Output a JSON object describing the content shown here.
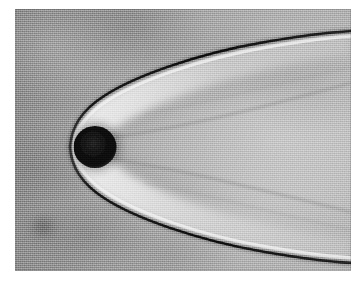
{
  "figure": {
    "kind": "schlieren-shadowgraph-photograph",
    "caption": "",
    "medium": "black-and-white photographic print",
    "border_color": "#ffffff",
    "print_area": {
      "x": 15,
      "y": 9,
      "width": 336,
      "height": 262
    }
  },
  "chart_data": {
    "type": "scatter",
    "title": "",
    "subtitle": "",
    "xlabel": "",
    "ylabel": "",
    "grid": false,
    "legend": "none",
    "xlim": [
      0,
      336
    ],
    "ylim": [
      0,
      262
    ],
    "description": "Shadowgraph of a detached bow shock wave formed ahead of a sphere in supersonic free flight; flow is from right to left, the shock opens downstream toward the right of the frame.",
    "annotations": [
      {
        "name": "sphere",
        "label": "",
        "cx": 80,
        "cy": 138,
        "r": 21,
        "tone": "#141414"
      },
      {
        "name": "shock-vertex",
        "label": "",
        "x": 55,
        "y": 138
      },
      {
        "name": "stand-off-distance-px",
        "label": "",
        "value": 4
      },
      {
        "name": "upper-shock-exit",
        "label": "",
        "x": 336,
        "y": 34
      },
      {
        "name": "lower-shock-exit",
        "label": "",
        "x": 336,
        "y": 226
      }
    ],
    "series": [
      {
        "name": "bow-shock-upper",
        "role": "primary-shock",
        "tone": "#1b1b1b",
        "points": [
          [
            55,
            138
          ],
          [
            58,
            122
          ],
          [
            64,
            110
          ],
          [
            74,
            99
          ],
          [
            88,
            89
          ],
          [
            106,
            80
          ],
          [
            130,
            70
          ],
          [
            160,
            60
          ],
          [
            196,
            50
          ],
          [
            240,
            41
          ],
          [
            290,
            33
          ],
          [
            336,
            27
          ]
        ]
      },
      {
        "name": "bow-shock-lower",
        "role": "primary-shock",
        "tone": "#1b1b1b",
        "points": [
          [
            55,
            138
          ],
          [
            58,
            154
          ],
          [
            64,
            167
          ],
          [
            75,
            179
          ],
          [
            90,
            190
          ],
          [
            110,
            200
          ],
          [
            136,
            211
          ],
          [
            168,
            221
          ],
          [
            206,
            230
          ],
          [
            252,
            238
          ],
          [
            296,
            244
          ],
          [
            336,
            249
          ]
        ]
      },
      {
        "name": "shock-layer-upper",
        "role": "bright-compression-band",
        "tone": "#e6e6e6",
        "points": [
          [
            60,
            138
          ],
          [
            63,
            124
          ],
          [
            70,
            112
          ],
          [
            80,
            101
          ],
          [
            95,
            92
          ],
          [
            114,
            83
          ],
          [
            140,
            74
          ],
          [
            172,
            64
          ],
          [
            210,
            55
          ],
          [
            254,
            46
          ],
          [
            300,
            39
          ],
          [
            336,
            34
          ]
        ]
      },
      {
        "name": "shock-layer-lower",
        "role": "bright-compression-band",
        "tone": "#e6e6e6",
        "points": [
          [
            60,
            138
          ],
          [
            63,
            152
          ],
          [
            70,
            164
          ],
          [
            81,
            176
          ],
          [
            96,
            186
          ],
          [
            117,
            196
          ],
          [
            143,
            206
          ],
          [
            175,
            216
          ],
          [
            212,
            224
          ],
          [
            257,
            232
          ],
          [
            300,
            238
          ],
          [
            336,
            242
          ]
        ]
      },
      {
        "name": "wake-boundary-upper",
        "role": "secondary-wave",
        "tone": "#8d8d8d",
        "points": [
          [
            100,
            128
          ],
          [
            126,
            124
          ],
          [
            158,
            118
          ],
          [
            196,
            110
          ],
          [
            238,
            100
          ],
          [
            284,
            88
          ],
          [
            336,
            74
          ]
        ]
      },
      {
        "name": "wake-boundary-lower",
        "role": "secondary-wave",
        "tone": "#8d8d8d",
        "points": [
          [
            100,
            150
          ],
          [
            126,
            155
          ],
          [
            158,
            161
          ],
          [
            196,
            169
          ],
          [
            238,
            179
          ],
          [
            284,
            190
          ],
          [
            336,
            203
          ]
        ]
      },
      {
        "name": "expansion-wave-upper",
        "role": "secondary-wave",
        "tone": "#9b9b9b",
        "points": [
          [
            130,
            105
          ],
          [
            170,
            97
          ],
          [
            214,
            87
          ],
          [
            262,
            75
          ],
          [
            336,
            58
          ]
        ]
      },
      {
        "name": "expansion-wave-lower",
        "role": "secondary-wave",
        "tone": "#9b9b9b",
        "points": [
          [
            130,
            174
          ],
          [
            170,
            182
          ],
          [
            214,
            192
          ],
          [
            262,
            204
          ],
          [
            336,
            221
          ]
        ]
      }
    ]
  },
  "regions": [
    {
      "name": "free-stream",
      "label": "",
      "tone": "#9a9a9a"
    },
    {
      "name": "shock-layer",
      "label": "",
      "tone": "#d8d8d8"
    },
    {
      "name": "wake",
      "label": "",
      "tone": "#b8b8b8"
    },
    {
      "name": "emulsion-smudge",
      "label": "",
      "tone": "#6a6a6a",
      "cx": 28,
      "cy": 218
    }
  ]
}
